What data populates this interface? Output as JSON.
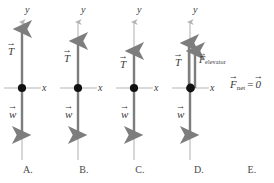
{
  "figure": {
    "axis_label_y": "y",
    "axis_label_x": "x",
    "colors": {
      "axis": "#b5b5b5",
      "force_vector": "#7d7d7d",
      "origin_dot": "#111111",
      "text": "#3a3a3a",
      "background": "#ffffff"
    }
  },
  "panels": [
    {
      "id": "A",
      "label": "A.",
      "axis": {
        "y_label": "y",
        "x_label": "x"
      },
      "vectors": [
        {
          "name": "tension",
          "symbol": "T",
          "direction": "up",
          "length_px": 61,
          "label_side": "left"
        },
        {
          "name": "weight",
          "symbol": "w",
          "direction": "down",
          "length_px": 49,
          "label_side": "left"
        }
      ]
    },
    {
      "id": "B",
      "label": "B.",
      "axis": {
        "y_label": "y",
        "x_label": "x"
      },
      "vectors": [
        {
          "name": "tension",
          "symbol": "T",
          "direction": "up",
          "length_px": 50,
          "label_side": "left"
        },
        {
          "name": "weight",
          "symbol": "w",
          "direction": "down",
          "length_px": 49,
          "label_side": "left"
        }
      ]
    },
    {
      "id": "C",
      "label": "C.",
      "axis": {
        "y_label": "y",
        "x_label": "x"
      },
      "vectors": [
        {
          "name": "tension",
          "symbol": "T",
          "direction": "up",
          "length_px": 40,
          "label_side": "left"
        },
        {
          "name": "weight",
          "symbol": "w",
          "direction": "down",
          "length_px": 49,
          "label_side": "left"
        }
      ]
    },
    {
      "id": "D",
      "label": "D.",
      "axis": {
        "y_label": "y",
        "x_label": "x"
      },
      "vectors": [
        {
          "name": "tension",
          "symbol": "T",
          "subscript": "",
          "direction": "up",
          "length_px": 48,
          "label_side": "left"
        },
        {
          "name": "elevator-force",
          "symbol": "F",
          "subscript": "elevator",
          "direction": "up",
          "length_px": 40,
          "label_side": "right"
        },
        {
          "name": "weight",
          "symbol": "w",
          "subscript": "",
          "direction": "down",
          "length_px": 49,
          "label_side": "left"
        }
      ]
    },
    {
      "id": "E",
      "label": "E.",
      "equation": {
        "lhs_symbol": "F",
        "lhs_subscript": "net",
        "operator": "=",
        "rhs_symbol": "0",
        "plain_text": "F_net = 0"
      }
    }
  ]
}
